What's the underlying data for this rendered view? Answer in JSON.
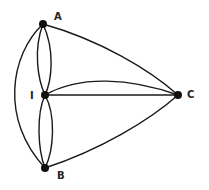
{
  "diagram": {
    "type": "multigraph",
    "nodes": [
      {
        "id": "A",
        "label": "A",
        "x": 43,
        "y": 24,
        "label_x": 54,
        "label_y": 20
      },
      {
        "id": "I",
        "label": "I",
        "x": 45,
        "y": 95,
        "label_x": 30,
        "label_y": 99
      },
      {
        "id": "B",
        "label": "B",
        "x": 45,
        "y": 168,
        "label_x": 57,
        "label_y": 179
      },
      {
        "id": "C",
        "label": "C",
        "x": 178,
        "y": 95,
        "label_x": 187,
        "label_y": 98
      }
    ],
    "edges": [
      {
        "from": "A",
        "to": "B",
        "shape": "outer-left-arc"
      },
      {
        "from": "A",
        "to": "I",
        "shape": "left-arc"
      },
      {
        "from": "A",
        "to": "I",
        "shape": "right-arc"
      },
      {
        "from": "I",
        "to": "B",
        "shape": "left-arc"
      },
      {
        "from": "I",
        "to": "B",
        "shape": "right-arc"
      },
      {
        "from": "A",
        "to": "C",
        "shape": "curve"
      },
      {
        "from": "I",
        "to": "C",
        "shape": "upper-curve"
      },
      {
        "from": "I",
        "to": "C",
        "shape": "straight"
      },
      {
        "from": "B",
        "to": "C",
        "shape": "curve"
      }
    ],
    "colors": {
      "edge": "#1a1a1a",
      "node": "#111111",
      "background": "#ffffff"
    }
  }
}
